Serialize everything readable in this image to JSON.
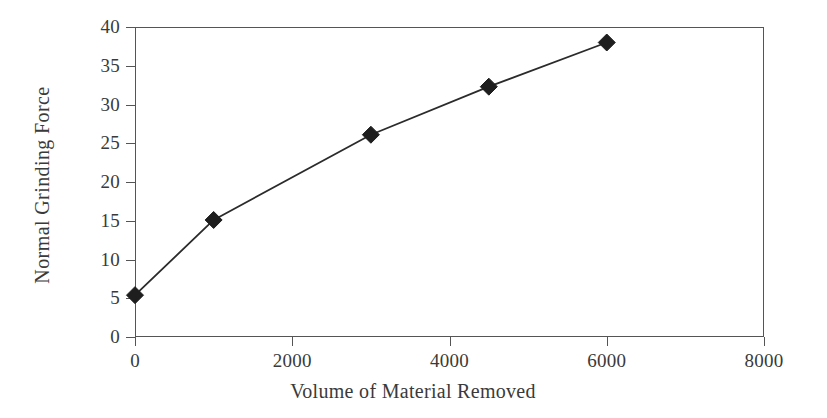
{
  "chart_data": {
    "type": "line",
    "title": "",
    "xlabel": "Volume of Material Removed",
    "ylabel": "Normal Grinding Force",
    "xlim": [
      0,
      8000
    ],
    "ylim": [
      0,
      40
    ],
    "xticks": [
      0,
      2000,
      4000,
      6000,
      8000
    ],
    "xtick_labels": [
      "0",
      "2000",
      "4000",
      "6000",
      "8000"
    ],
    "yticks": [
      0,
      5,
      10,
      15,
      20,
      25,
      30,
      35,
      40
    ],
    "ytick_labels": [
      "0",
      "5",
      "10",
      "15",
      "20",
      "25",
      "30",
      "35",
      "40"
    ],
    "grid": false,
    "legend": null,
    "series": [
      {
        "name": "Normal Grinding Force",
        "marker": "filled-diamond",
        "marker_color": "#1e1e1e",
        "line_color": "#2b2b2b",
        "x": [
          0,
          1000,
          3000,
          4500,
          6000
        ],
        "values": [
          5.4,
          15.1,
          26.1,
          32.3,
          38.0
        ],
        "points": [
          {
            "x": 0,
            "y": 5.4
          },
          {
            "x": 1000,
            "y": 15.1
          },
          {
            "x": 3000,
            "y": 26.1
          },
          {
            "x": 4500,
            "y": 32.3
          },
          {
            "x": 6000,
            "y": 38.0
          }
        ]
      }
    ]
  },
  "colors": {
    "background": "#ffffff",
    "axis": "#555555",
    "text": "#3a3a3a",
    "line": "#2b2b2b",
    "marker": "#1e1e1e"
  }
}
